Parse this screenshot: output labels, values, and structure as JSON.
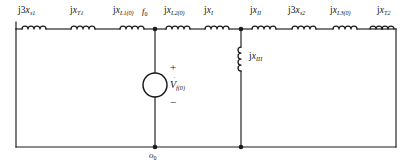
{
  "diagram": {
    "colors": {
      "wire": "#1b1b1b",
      "background": "#ffffff",
      "text": "#141414"
    }
  },
  "series_elements": [
    {
      "key": "xs1",
      "prefix": "j3",
      "symbol": "x",
      "subscript": "s1",
      "full": "j3x_s1"
    },
    {
      "key": "xt1",
      "prefix": "j",
      "symbol": "x",
      "subscript": "T1",
      "full": "jx_T1"
    },
    {
      "key": "xl10",
      "prefix": "j",
      "symbol": "x",
      "subscript": "L1(0)",
      "full": "jx_L1(0)"
    },
    {
      "key": "xl20",
      "prefix": "j",
      "symbol": "x",
      "subscript": "L2(0)",
      "full": "jx_L2(0)"
    },
    {
      "key": "xi",
      "prefix": "j",
      "symbol": "x",
      "subscript": "I",
      "full": "jx_I"
    },
    {
      "key": "xii",
      "prefix": "j",
      "symbol": "x",
      "subscript": "II",
      "full": "jx_II"
    },
    {
      "key": "xs2",
      "prefix": "j3",
      "symbol": "x",
      "subscript": "s2",
      "full": "j3x_s2"
    },
    {
      "key": "xl30",
      "prefix": "j",
      "symbol": "x",
      "subscript": "L3(0)",
      "full": "jx_L3(0)"
    },
    {
      "key": "xt2",
      "prefix": "j",
      "symbol": "x",
      "subscript": "T2",
      "full": "jx_T2"
    }
  ],
  "shunt_element": {
    "key": "xiii",
    "prefix": "j",
    "symbol": "x",
    "subscript": "III",
    "full": "jx_III"
  },
  "source": {
    "symbol": "V",
    "accent": "˙",
    "subscript": "f(0)",
    "plus": "+",
    "minus": "−",
    "full": "V̇_f(0)"
  },
  "nodes": [
    {
      "key": "f0",
      "symbol": "f",
      "subscript": "0",
      "full": "f_0"
    },
    {
      "key": "o0",
      "symbol": "o",
      "subscript": "0",
      "full": "o_0"
    }
  ]
}
